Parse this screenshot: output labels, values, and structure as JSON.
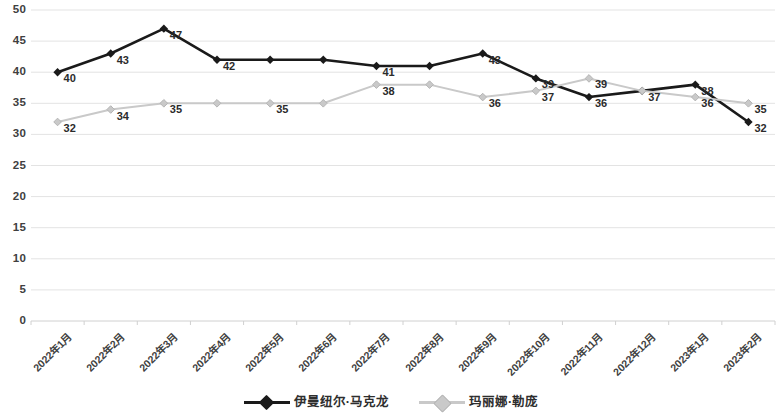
{
  "chart_data": {
    "type": "line",
    "title": "",
    "subtitle": "",
    "xlabel": "",
    "ylabel": "",
    "ylim": [
      0,
      50
    ],
    "yticks": [
      0,
      5,
      10,
      15,
      20,
      25,
      30,
      35,
      40,
      45,
      50
    ],
    "grid": true,
    "legend_position": "bottom",
    "categories": [
      "2022年1月",
      "2022年2月",
      "2022年3月",
      "2022年4月",
      "2022年5月",
      "2022年6月",
      "2022年7月",
      "2022年8月",
      "2022年9月",
      "2022年10月",
      "2022年11月",
      "2022年12月",
      "2023年1月",
      "2023年2月"
    ],
    "series": [
      {
        "name": "伊曼纽尔·马克龙",
        "color": "#1a1a1a",
        "marker": "diamond",
        "values": [
          40,
          43,
          47,
          42,
          42,
          42,
          41,
          41,
          43,
          39,
          36,
          37,
          38,
          32
        ],
        "point_labels": [
          "40",
          "43",
          "47",
          "42",
          "",
          "",
          "41",
          "",
          "43",
          "39",
          "36",
          "37",
          "38",
          "32"
        ]
      },
      {
        "name": "玛丽娜·勒庞",
        "color": "#c9c9c9",
        "marker": "diamond",
        "values": [
          32,
          34,
          35,
          35,
          35,
          35,
          38,
          38,
          36,
          37,
          39,
          37,
          36,
          35
        ],
        "point_labels": [
          "32",
          "34",
          "35",
          "",
          "35",
          "",
          "38",
          "",
          "36",
          "37",
          "39",
          "",
          "36",
          "35"
        ]
      }
    ]
  },
  "legend": {
    "items": [
      {
        "label": "伊曼纽尔·马克龙",
        "color": "#1a1a1a"
      },
      {
        "label": "玛丽娜·勒庞",
        "color": "#c9c9c9"
      }
    ]
  },
  "colors": {
    "series_1": "#1a1a1a",
    "series_2": "#c9c9c9",
    "gridline": "#e3e3e3",
    "axis_text": "#404040",
    "background": "#ffffff"
  }
}
